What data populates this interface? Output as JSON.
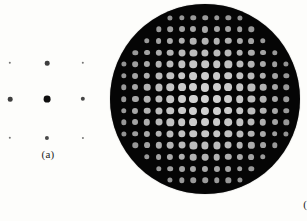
{
  "figure": {
    "background_color": "#fdfdfb",
    "width": 307,
    "height": 221
  },
  "panels": [
    {
      "id": "a",
      "caption": "(a)",
      "caption_x": 48,
      "caption_y": 148,
      "description": "sparse square array of dark diffraction spots on white background",
      "background_color": "#ffffff",
      "dot_color": "#141414"
    },
    {
      "id": "b",
      "caption": "(b)",
      "caption_x": 205,
      "caption_y": 198,
      "description": "circular dark field filled with a bright square lattice of diffraction spots",
      "disk_color": "#050505",
      "dot_color": "#cccccc",
      "disk_center_x": 205,
      "disk_center_y": 99,
      "disk_radius": 95
    }
  ],
  "chart_data": [
    {
      "type": "scatter",
      "panel": "a",
      "title": "(a)",
      "xlabel": "",
      "ylabel": "",
      "grid": false,
      "legend": "none",
      "xlim": [
        0,
        105
      ],
      "ylim": [
        0,
        175
      ],
      "marker_color": "#141414",
      "background": "#ffffff",
      "note": "3 x 3 lattice of diffraction orders; marker area encodes intensity, brightest (largest) at centre order (0,0)",
      "columns_x": [
        10,
        47,
        83
      ],
      "rows_y": [
        63,
        99,
        138
      ],
      "points": [
        {
          "order": [
            -1,
            1
          ],
          "x": 10,
          "y": 63,
          "r": 1.2,
          "intensity": 0.12
        },
        {
          "order": [
            0,
            1
          ],
          "x": 47,
          "y": 63,
          "r": 2.3,
          "intensity": 0.42
        },
        {
          "order": [
            1,
            1
          ],
          "x": 83,
          "y": 63,
          "r": 1.2,
          "intensity": 0.12
        },
        {
          "order": [
            -1,
            0
          ],
          "x": 10,
          "y": 99,
          "r": 2.3,
          "intensity": 0.42
        },
        {
          "order": [
            0,
            0
          ],
          "x": 47,
          "y": 99,
          "r": 3.4,
          "intensity": 1.0
        },
        {
          "order": [
            1,
            0
          ],
          "x": 83,
          "y": 99,
          "r": 2.2,
          "intensity": 0.38
        },
        {
          "order": [
            -1,
            -1
          ],
          "x": 10,
          "y": 138,
          "r": 1.2,
          "intensity": 0.12
        },
        {
          "order": [
            0,
            -1
          ],
          "x": 47,
          "y": 138,
          "r": 2.1,
          "intensity": 0.36
        },
        {
          "order": [
            1,
            -1
          ],
          "x": 83,
          "y": 138,
          "r": 1.1,
          "intensity": 0.1
        }
      ]
    },
    {
      "type": "scatter",
      "panel": "b",
      "title": "(b)",
      "xlabel": "",
      "ylabel": "",
      "grid": false,
      "legend": "none",
      "background": "#050505",
      "marker_color": "#cccccc",
      "note": "15 x 15 square lattice of bright diffraction orders inside a circular aperture; spot size and brightness fall off radially from the centre",
      "grid_columns": 15,
      "grid_rows": 15,
      "spacing_px": 11.6,
      "center_x": 205,
      "center_y": 99,
      "disk_radius": 95,
      "max_marker_radius": 4.1,
      "min_marker_radius": 0.7,
      "falloff_sigma": 5.2,
      "brightness_max": "#d2d2d2",
      "brightness_min": "#2a2a2a"
    }
  ]
}
